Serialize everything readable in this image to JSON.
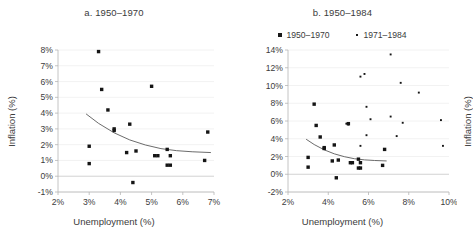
{
  "figure": {
    "panels": [
      {
        "id": "a",
        "title": "a. 1950–1970",
        "xlabel": "Unemployment (%)",
        "ylabel": "Inflation (%)"
      },
      {
        "id": "b",
        "title": "b. 1950–1984",
        "xlabel": "Unemployment (%)",
        "ylabel": "Inflation (%)"
      }
    ],
    "legend": {
      "position": "top-center-panel-b",
      "entries": [
        {
          "label": "1950–1970",
          "marker": "filled-square",
          "color": "#151515"
        },
        {
          "label": "1971–1984",
          "marker": "small-dot",
          "color": "#151515"
        }
      ]
    }
  },
  "chart_data": [
    {
      "type": "scatter",
      "panel": "a",
      "title": "a. 1950–1970",
      "xlabel": "Unemployment (%)",
      "ylabel": "Inflation (%)",
      "xlim": [
        2,
        7
      ],
      "ylim": [
        -1,
        8
      ],
      "xticks": [
        "2%",
        "3%",
        "4%",
        "5%",
        "6%",
        "7%"
      ],
      "xtick_values": [
        2,
        3,
        4,
        5,
        6,
        7
      ],
      "yticks": [
        "-1%",
        "0%",
        "1%",
        "2%",
        "3%",
        "4%",
        "5%",
        "6%",
        "7%",
        "8%"
      ],
      "ytick_values": [
        -1,
        0,
        1,
        2,
        3,
        4,
        5,
        6,
        7,
        8
      ],
      "grid": "horizontal",
      "legend": "none",
      "series": [
        {
          "name": "1950–1970",
          "marker": "filled-square",
          "points": [
            [
              3.0,
              0.8
            ],
            [
              3.0,
              1.9
            ],
            [
              3.3,
              7.9
            ],
            [
              3.4,
              5.5
            ],
            [
              3.6,
              4.2
            ],
            [
              3.8,
              2.9
            ],
            [
              3.8,
              3.0
            ],
            [
              4.2,
              1.5
            ],
            [
              4.3,
              3.3
            ],
            [
              4.4,
              -0.4
            ],
            [
              4.5,
              1.6
            ],
            [
              5.1,
              1.3
            ],
            [
              5.2,
              1.3
            ],
            [
              5.0,
              5.7
            ],
            [
              5.5,
              1.7
            ],
            [
              5.5,
              0.7
            ],
            [
              5.6,
              1.3
            ],
            [
              5.6,
              0.7
            ],
            [
              6.7,
              1.0
            ],
            [
              6.8,
              2.8
            ]
          ]
        }
      ],
      "trend": {
        "name": "fitted Phillips curve",
        "points": [
          [
            2.9,
            3.95
          ],
          [
            3.3,
            3.35
          ],
          [
            3.8,
            2.75
          ],
          [
            4.3,
            2.3
          ],
          [
            4.8,
            1.98
          ],
          [
            5.3,
            1.75
          ],
          [
            5.8,
            1.62
          ],
          [
            6.3,
            1.55
          ],
          [
            6.9,
            1.5
          ]
        ]
      }
    },
    {
      "type": "scatter",
      "panel": "b",
      "title": "b. 1950–1984",
      "xlabel": "Unemployment (%)",
      "ylabel": "Inflation (%)",
      "xlim": [
        2,
        10
      ],
      "ylim": [
        -2,
        14
      ],
      "xticks": [
        "2%",
        "4%",
        "6%",
        "8%",
        "10%"
      ],
      "xtick_values": [
        2,
        4,
        6,
        8,
        10
      ],
      "yticks": [
        "-2%",
        "0%",
        "2%",
        "4%",
        "6%",
        "8%",
        "10%",
        "12%",
        "14%"
      ],
      "ytick_values": [
        -2,
        0,
        2,
        4,
        6,
        8,
        10,
        12,
        14
      ],
      "grid": "horizontal",
      "legend": "top",
      "series": [
        {
          "name": "1950–1970",
          "marker": "filled-square",
          "points": [
            [
              3.0,
              0.8
            ],
            [
              3.0,
              1.9
            ],
            [
              3.3,
              7.9
            ],
            [
              3.4,
              5.5
            ],
            [
              3.6,
              4.2
            ],
            [
              3.8,
              2.9
            ],
            [
              3.8,
              3.0
            ],
            [
              4.2,
              1.5
            ],
            [
              4.3,
              3.3
            ],
            [
              4.4,
              -0.4
            ],
            [
              4.5,
              1.6
            ],
            [
              5.1,
              1.3
            ],
            [
              5.2,
              1.3
            ],
            [
              5.0,
              5.7
            ],
            [
              5.5,
              1.7
            ],
            [
              5.5,
              0.7
            ],
            [
              5.6,
              1.3
            ],
            [
              5.6,
              0.7
            ],
            [
              6.7,
              1.0
            ],
            [
              6.8,
              2.8
            ]
          ]
        },
        {
          "name": "1971–1984",
          "marker": "small-dot",
          "points": [
            [
              4.9,
              5.7
            ],
            [
              5.0,
              5.6
            ],
            [
              5.6,
              3.2
            ],
            [
              5.6,
              11.0
            ],
            [
              5.8,
              11.3
            ],
            [
              5.9,
              4.4
            ],
            [
              5.9,
              7.6
            ],
            [
              6.1,
              6.2
            ],
            [
              7.1,
              13.5
            ],
            [
              7.1,
              6.5
            ],
            [
              7.4,
              4.3
            ],
            [
              7.6,
              10.3
            ],
            [
              7.7,
              5.8
            ],
            [
              8.5,
              9.2
            ],
            [
              9.6,
              6.1
            ],
            [
              9.7,
              3.2
            ]
          ]
        }
      ],
      "trend": {
        "name": "fitted Phillips curve",
        "points": [
          [
            2.9,
            3.95
          ],
          [
            3.3,
            3.35
          ],
          [
            3.8,
            2.75
          ],
          [
            4.3,
            2.3
          ],
          [
            4.8,
            1.98
          ],
          [
            5.3,
            1.75
          ],
          [
            5.8,
            1.62
          ],
          [
            6.3,
            1.55
          ],
          [
            6.9,
            1.5
          ]
        ]
      }
    }
  ]
}
